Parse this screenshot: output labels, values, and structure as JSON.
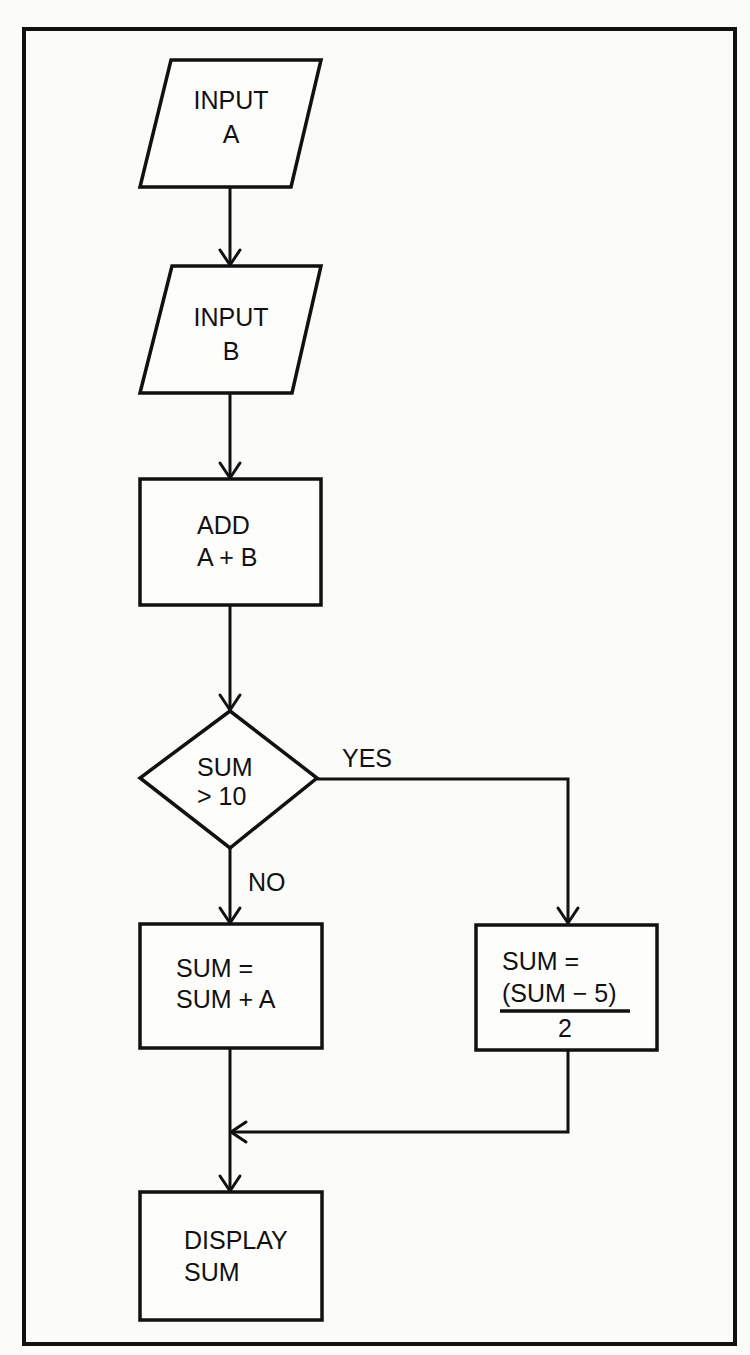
{
  "diagram": {
    "type": "flowchart",
    "nodes": {
      "input_a": {
        "shape": "parallelogram",
        "lines": [
          "INPUT",
          "A"
        ]
      },
      "input_b": {
        "shape": "parallelogram",
        "lines": [
          "INPUT",
          "B"
        ]
      },
      "add": {
        "shape": "rectangle",
        "lines": [
          "ADD",
          "A + B"
        ]
      },
      "decision": {
        "shape": "diamond",
        "lines": [
          "SUM",
          "> 10"
        ]
      },
      "sum_plus_a": {
        "shape": "rectangle",
        "lines": [
          "SUM =",
          "SUM + A"
        ]
      },
      "sum_minus_5": {
        "shape": "rectangle",
        "lines": [
          "SUM =",
          "(SUM −  5)",
          "2"
        ]
      },
      "display": {
        "shape": "rectangle",
        "lines": [
          "DISPLAY",
          "SUM"
        ]
      }
    },
    "edges": [
      {
        "from": "input_a",
        "to": "input_b",
        "label": ""
      },
      {
        "from": "input_b",
        "to": "add",
        "label": ""
      },
      {
        "from": "add",
        "to": "decision",
        "label": ""
      },
      {
        "from": "decision",
        "to": "sum_minus_5",
        "label": "YES"
      },
      {
        "from": "decision",
        "to": "sum_plus_a",
        "label": "NO"
      },
      {
        "from": "sum_minus_5",
        "to": "display",
        "label": ""
      },
      {
        "from": "sum_plus_a",
        "to": "display",
        "label": ""
      }
    ],
    "labels": {
      "yes": "YES",
      "no": "NO"
    },
    "colors": {
      "stroke": "#111111",
      "background": "#fbfbf9"
    }
  }
}
